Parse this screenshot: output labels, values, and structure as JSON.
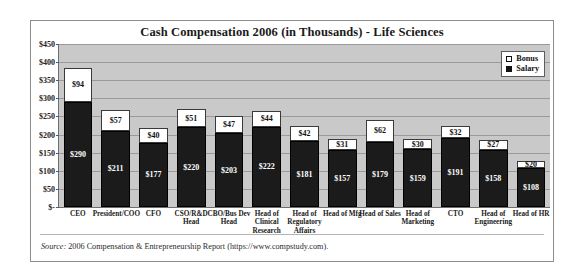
{
  "chart_data": {
    "type": "bar",
    "title": "Cash Compensation 2006 (in Thousands) - Life Sciences",
    "xlabel": "",
    "ylabel": "",
    "ylim": [
      0,
      450
    ],
    "ytick_labels": [
      "$450",
      "$400",
      "$350",
      "$300",
      "$250",
      "$200",
      "$150",
      "$100",
      "$50",
      "$-"
    ],
    "ytick_values": [
      450,
      400,
      350,
      300,
      250,
      200,
      150,
      100,
      50,
      0
    ],
    "grid": true,
    "stacked": true,
    "legend_position": "top-right",
    "categories": [
      "CEO",
      "President/COO",
      "CFO",
      "CSO/R&D Head",
      "CBO/Bus Dev Head",
      "Head of Clinical Research",
      "Head of Regulatory Affairs",
      "Head of Mfg",
      "Head of Sales",
      "Head of Marketing",
      "CTO",
      "Head of Engineering",
      "Head of HR"
    ],
    "series": [
      {
        "name": "Salary",
        "color": "#1b1b1b",
        "values": [
          290,
          211,
          177,
          220,
          203,
          222,
          181,
          157,
          179,
          159,
          191,
          158,
          108
        ],
        "labels": [
          "$290",
          "$211",
          "$177",
          "$220",
          "$203",
          "$222",
          "$181",
          "$157",
          "$179",
          "$159",
          "$191",
          "$158",
          "$108"
        ]
      },
      {
        "name": "Bonus",
        "color": "#ffffff",
        "values": [
          94,
          57,
          40,
          51,
          47,
          44,
          42,
          31,
          62,
          30,
          32,
          27,
          20
        ],
        "labels": [
          "$94",
          "$57",
          "$40",
          "$51",
          "$47",
          "$44",
          "$42",
          "$31",
          "$62",
          "$30",
          "$32",
          "$27",
          "$20"
        ]
      }
    ]
  },
  "legend": {
    "items": [
      {
        "label": "Bonus",
        "swatch": "bonus"
      },
      {
        "label": "Salary",
        "swatch": "salary"
      }
    ]
  },
  "footer": {
    "source_word": "Source:",
    "source_text": " 2006 Compensation & Entrepreneurship Report (https://www.compstudy.com)."
  }
}
